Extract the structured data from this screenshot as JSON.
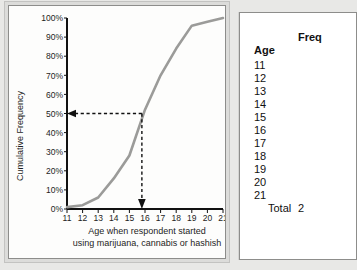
{
  "chart_data": {
    "type": "line",
    "title": "",
    "xlabel": "Age when respondent started using marijuana, cannabis or hashish",
    "xlabel_line1": "Age when respondent started",
    "xlabel_line2": "using marijuana, cannabis or hashish",
    "ylabel": "Cumulative Frequency",
    "xlim": [
      11,
      21
    ],
    "ylim": [
      0,
      100
    ],
    "grid": false,
    "legend": null,
    "x": [
      11,
      12,
      13,
      14,
      15,
      16,
      17,
      18,
      19,
      20,
      21
    ],
    "xtick_labels": [
      "11",
      "12",
      "13",
      "14",
      "15",
      "16",
      "17",
      "18",
      "19",
      "20",
      "21"
    ],
    "ytick_labels": [
      "0%",
      "10%",
      "20%",
      "30%",
      "40%",
      "50%",
      "60%",
      "70%",
      "80%",
      "90%",
      "100%"
    ],
    "ytick_values": [
      0,
      10,
      20,
      30,
      40,
      50,
      60,
      70,
      80,
      90,
      100
    ],
    "series": [
      {
        "name": "Cumulative Frequency",
        "values": [
          1,
          2,
          6,
          16,
          28,
          52,
          70,
          84,
          96,
          98,
          100
        ],
        "color": "#9b9b99"
      }
    ],
    "annotations": [
      {
        "name": "median-horizontal",
        "type": "dashed-arrow",
        "from": [
          15.8,
          50
        ],
        "to": [
          11,
          50
        ],
        "label": "50%"
      },
      {
        "name": "median-vertical",
        "type": "dashed-arrow",
        "from": [
          15.8,
          50
        ],
        "to": [
          15.8,
          0
        ],
        "label": "median age ~15.8"
      }
    ]
  },
  "chart": {
    "ylabel": "Cumulative Frequency",
    "xcaption_line1": "Age when respondent started",
    "xcaption_line2": "using marijuana, cannabis or hashish"
  },
  "table": {
    "header_span": "Freq",
    "header_age": "Age",
    "rows": [
      {
        "age": "11",
        "value": ""
      },
      {
        "age": "12",
        "value": ""
      },
      {
        "age": "13",
        "value": ""
      },
      {
        "age": "14",
        "value": ""
      },
      {
        "age": "15",
        "value": ""
      },
      {
        "age": "16",
        "value": ""
      },
      {
        "age": "17",
        "value": ""
      },
      {
        "age": "18",
        "value": ""
      },
      {
        "age": "19",
        "value": ""
      },
      {
        "age": "20",
        "value": ""
      },
      {
        "age": "21",
        "value": ""
      }
    ],
    "total_label": "Total",
    "total_value": "2"
  },
  "colors": {
    "curve": "#9b9b99",
    "axis": "#111111",
    "panel_bg": "#fdfdfc",
    "page_bg": "#e8e8e6",
    "frame": "#8d8d8b"
  }
}
